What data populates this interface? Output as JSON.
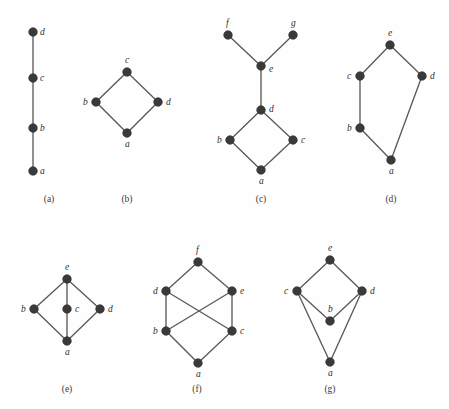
{
  "figure": {
    "background_color": "#fefefe",
    "node_color": "#3a3a3a",
    "edge_color": "#5a5a5a",
    "label_color": "#2e2e2e",
    "panels": [
      {
        "id": "a",
        "caption": "(a)",
        "caption_x": 49,
        "caption_y": 202,
        "nodes": [
          {
            "name": "d",
            "x": 33,
            "y": 32,
            "label_dx": 7,
            "label_dy": 3
          },
          {
            "name": "c",
            "x": 33,
            "y": 78,
            "label_dx": 7,
            "label_dy": 3
          },
          {
            "name": "b",
            "x": 33,
            "y": 128,
            "label_dx": 7,
            "label_dy": 3
          },
          {
            "name": "a",
            "x": 33,
            "y": 171,
            "label_dx": 7,
            "label_dy": 3
          }
        ],
        "edges": [
          [
            "a",
            "b"
          ],
          [
            "b",
            "c"
          ],
          [
            "c",
            "d"
          ]
        ]
      },
      {
        "id": "b",
        "caption": "(b)",
        "caption_x": 127,
        "caption_y": 202,
        "nodes": [
          {
            "name": "c",
            "x": 127,
            "y": 72,
            "label_dx": -2,
            "label_dy": -9
          },
          {
            "name": "b",
            "x": 96,
            "y": 102,
            "label_dx": -13,
            "label_dy": 3
          },
          {
            "name": "d",
            "x": 158,
            "y": 102,
            "label_dx": 8,
            "label_dy": 3
          },
          {
            "name": "a",
            "x": 127,
            "y": 133,
            "label_dx": -2,
            "label_dy": 14
          }
        ],
        "edges": [
          [
            "a",
            "b"
          ],
          [
            "a",
            "d"
          ],
          [
            "b",
            "c"
          ],
          [
            "d",
            "c"
          ]
        ]
      },
      {
        "id": "c",
        "caption": "(c)",
        "caption_x": 261,
        "caption_y": 202,
        "nodes": [
          {
            "name": "f",
            "x": 228,
            "y": 35,
            "label_dx": -2,
            "label_dy": -9
          },
          {
            "name": "g",
            "x": 293,
            "y": 35,
            "label_dx": -2,
            "label_dy": -9
          },
          {
            "name": "e",
            "x": 261,
            "y": 66,
            "label_dx": 8,
            "label_dy": 6
          },
          {
            "name": "d",
            "x": 261,
            "y": 110,
            "label_dx": 8,
            "label_dy": 2
          },
          {
            "name": "b",
            "x": 230,
            "y": 140,
            "label_dx": -13,
            "label_dy": 3
          },
          {
            "name": "c",
            "x": 293,
            "y": 140,
            "label_dx": 8,
            "label_dy": 3
          },
          {
            "name": "a",
            "x": 261,
            "y": 170,
            "label_dx": -2,
            "label_dy": 14
          }
        ],
        "edges": [
          [
            "a",
            "b"
          ],
          [
            "a",
            "c"
          ],
          [
            "b",
            "d"
          ],
          [
            "c",
            "d"
          ],
          [
            "d",
            "e"
          ],
          [
            "e",
            "f"
          ],
          [
            "e",
            "g"
          ]
        ]
      },
      {
        "id": "d",
        "caption": "(d)",
        "caption_x": 391,
        "caption_y": 202,
        "nodes": [
          {
            "name": "e",
            "x": 390,
            "y": 45,
            "label_dx": -2,
            "label_dy": -9
          },
          {
            "name": "c",
            "x": 360,
            "y": 76,
            "label_dx": -13,
            "label_dy": 3
          },
          {
            "name": "d",
            "x": 422,
            "y": 76,
            "label_dx": 8,
            "label_dy": 3
          },
          {
            "name": "b",
            "x": 360,
            "y": 128,
            "label_dx": -13,
            "label_dy": 3
          },
          {
            "name": "a",
            "x": 391,
            "y": 160,
            "label_dx": -2,
            "label_dy": 14
          }
        ],
        "edges": [
          [
            "a",
            "b"
          ],
          [
            "a",
            "d"
          ],
          [
            "b",
            "c"
          ],
          [
            "c",
            "e"
          ],
          [
            "d",
            "e"
          ]
        ]
      },
      {
        "id": "e",
        "caption": "(e)",
        "caption_x": 67,
        "caption_y": 392,
        "nodes": [
          {
            "name": "e",
            "x": 67,
            "y": 279,
            "label_dx": -2,
            "label_dy": -9
          },
          {
            "name": "b",
            "x": 34,
            "y": 309,
            "label_dx": -13,
            "label_dy": 3
          },
          {
            "name": "c",
            "x": 67,
            "y": 309,
            "label_dx": 8,
            "label_dy": 3
          },
          {
            "name": "d",
            "x": 100,
            "y": 309,
            "label_dx": 8,
            "label_dy": 3
          },
          {
            "name": "a",
            "x": 67,
            "y": 341,
            "label_dx": -2,
            "label_dy": 14
          }
        ],
        "edges": [
          [
            "a",
            "b"
          ],
          [
            "a",
            "c"
          ],
          [
            "a",
            "d"
          ],
          [
            "b",
            "e"
          ],
          [
            "c",
            "e"
          ],
          [
            "d",
            "e"
          ]
        ]
      },
      {
        "id": "f",
        "caption": "(f)",
        "caption_x": 197,
        "caption_y": 392,
        "nodes": [
          {
            "name": "f",
            "x": 198,
            "y": 262,
            "label_dx": -2,
            "label_dy": -9
          },
          {
            "name": "d",
            "x": 166,
            "y": 291,
            "label_dx": -13,
            "label_dy": 3
          },
          {
            "name": "e",
            "x": 232,
            "y": 291,
            "label_dx": 8,
            "label_dy": 3
          },
          {
            "name": "b",
            "x": 166,
            "y": 331,
            "label_dx": -13,
            "label_dy": 3
          },
          {
            "name": "c",
            "x": 232,
            "y": 331,
            "label_dx": 8,
            "label_dy": 3
          },
          {
            "name": "a",
            "x": 198,
            "y": 363,
            "label_dx": -2,
            "label_dy": 14
          }
        ],
        "edges": [
          [
            "a",
            "b"
          ],
          [
            "a",
            "c"
          ],
          [
            "b",
            "d"
          ],
          [
            "b",
            "e"
          ],
          [
            "c",
            "d"
          ],
          [
            "c",
            "e"
          ],
          [
            "d",
            "f"
          ],
          [
            "e",
            "f"
          ]
        ]
      },
      {
        "id": "g",
        "caption": "(g)",
        "caption_x": 330,
        "caption_y": 392,
        "nodes": [
          {
            "name": "e",
            "x": 330,
            "y": 260,
            "label_dx": -2,
            "label_dy": -9
          },
          {
            "name": "c",
            "x": 297,
            "y": 291,
            "label_dx": -13,
            "label_dy": 3
          },
          {
            "name": "d",
            "x": 362,
            "y": 291,
            "label_dx": 8,
            "label_dy": 3
          },
          {
            "name": "b",
            "x": 330,
            "y": 321,
            "label_dx": -2,
            "label_dy": -9
          },
          {
            "name": "a",
            "x": 330,
            "y": 362,
            "label_dx": -2,
            "label_dy": 14
          }
        ],
        "edges": [
          [
            "a",
            "c"
          ],
          [
            "a",
            "d"
          ],
          [
            "b",
            "c"
          ],
          [
            "b",
            "d"
          ],
          [
            "c",
            "e"
          ],
          [
            "d",
            "e"
          ]
        ]
      }
    ]
  }
}
